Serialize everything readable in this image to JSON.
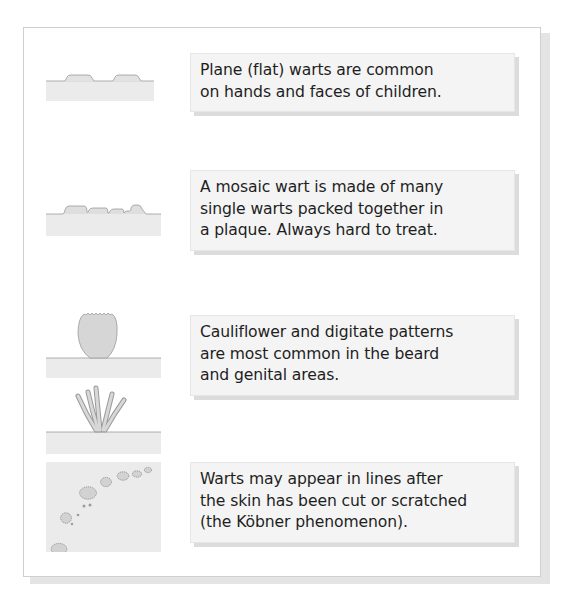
{
  "figure": {
    "items": [
      {
        "illustration": "plane-wart-icon",
        "lines": [
          "Plane (flat) warts are common",
          "on hands and faces of children."
        ]
      },
      {
        "illustration": "mosaic-wart-icon",
        "lines": [
          "A mosaic wart is made of many",
          "single warts packed together in",
          "a plaque. Always hard to treat."
        ]
      },
      {
        "illustration": "cauliflower-digitate-wart-icon",
        "lines": [
          "Cauliflower and digitate patterns",
          "are most common in the beard",
          "and genital areas."
        ]
      },
      {
        "illustration": "koebner-phenomenon-icon",
        "lines": [
          "Warts may appear in lines after",
          "the skin has been cut or scratched",
          "(the Köbner phenomenon)."
        ]
      }
    ],
    "colors": {
      "skin_fill": "#ebebeb",
      "skin_line": "#9a9a9a",
      "wart_fill": "#d6d6d6",
      "box_fill": "#f4f4f4",
      "text": "#1e1e1e",
      "frame_border": "#cfcfcf"
    }
  }
}
